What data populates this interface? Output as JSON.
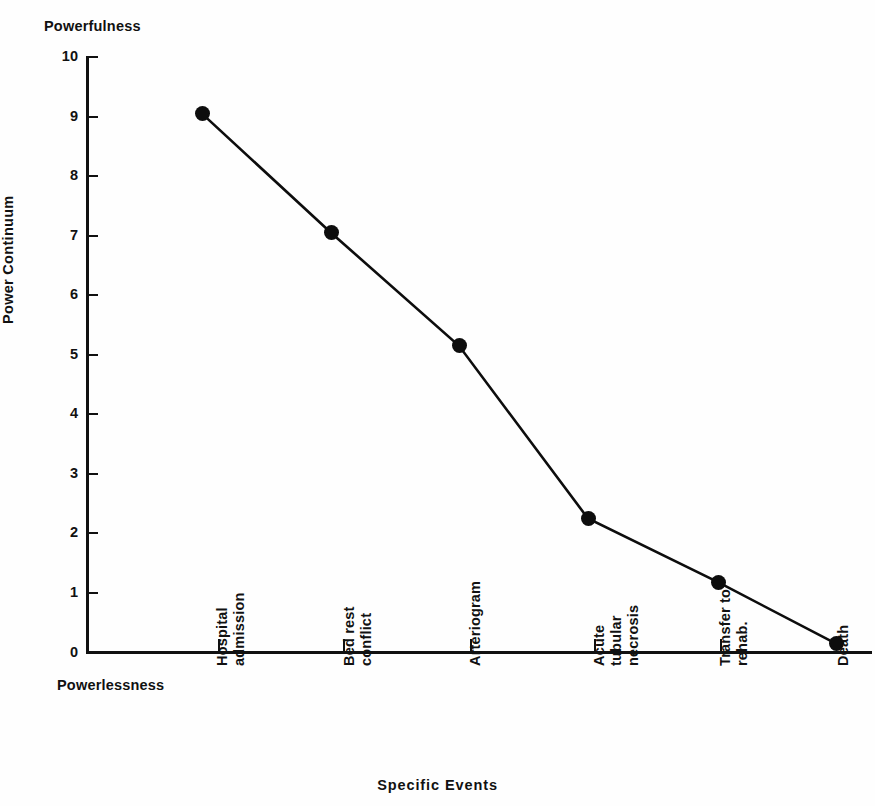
{
  "figure": {
    "top_axis_label": "Powerfulness",
    "bottom_axis_label": "Powerlessness",
    "ylabel": "Power Continuum",
    "xlabel": "Specific Events",
    "line_color": "#0d0d0d",
    "marker_color": "#0d0d0d",
    "axis_color": "#111111",
    "background": "#fefefe"
  },
  "chart_data": {
    "type": "line",
    "title": "",
    "subtitle": "",
    "xlabel": "Specific Events",
    "ylabel": "Power Continuum",
    "ylim": [
      0,
      10
    ],
    "yticks": [
      0,
      1,
      2,
      3,
      4,
      5,
      6,
      7,
      8,
      9,
      10
    ],
    "ytick_labels": [
      "0",
      "1",
      "2",
      "3",
      "4",
      "5",
      "6",
      "7",
      "8",
      "9",
      "10"
    ],
    "grid": false,
    "legend": null,
    "axis_annotations": {
      "y_axis_top": "Powerfulness",
      "y_axis_bottom": "Powerlessness"
    },
    "categories": [
      "Hospital admission",
      "Bed rest conflict",
      "Arteriogram",
      "Acute tubular necrosis",
      "Transfer to rehab.",
      "Death"
    ],
    "category_lines": [
      [
        "Hospital",
        "admission"
      ],
      [
        "Bed rest",
        "conflict"
      ],
      [
        "Arteriogram"
      ],
      [
        "Acute",
        "tubular",
        "necrosis"
      ],
      [
        "Transfer to",
        "rehab."
      ],
      [
        "Death"
      ]
    ],
    "values": [
      9.05,
      7.05,
      5.15,
      2.25,
      1.18,
      0.15
    ],
    "series": [
      {
        "name": "Power Continuum",
        "values": [
          9.05,
          7.05,
          5.15,
          2.25,
          1.18,
          0.15
        ]
      }
    ],
    "marker": "filled-circle",
    "marker_count": 6
  }
}
